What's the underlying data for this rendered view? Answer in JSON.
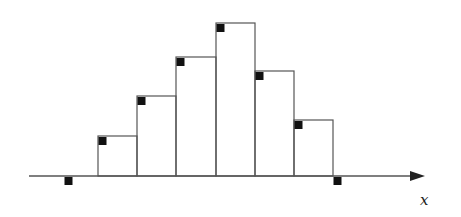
{
  "chart_data": {
    "type": "bar",
    "title": "",
    "xlabel": "x",
    "ylabel": "",
    "grid": false,
    "bins": [
      {
        "left": 98,
        "right": 137,
        "height": 40
      },
      {
        "left": 137,
        "right": 176,
        "height": 80
      },
      {
        "left": 176,
        "right": 216,
        "height": 119
      },
      {
        "left": 216,
        "right": 255,
        "height": 153
      },
      {
        "left": 255,
        "right": 294,
        "height": 105
      },
      {
        "left": 294,
        "right": 333,
        "height": 56
      }
    ],
    "values": [
      40,
      80,
      119,
      153,
      105,
      56
    ],
    "markers": [
      {
        "x": 64,
        "y": 0,
        "below_axis": true
      },
      {
        "x": 98,
        "y": 40
      },
      {
        "x": 137,
        "y": 80
      },
      {
        "x": 176,
        "y": 119
      },
      {
        "x": 216,
        "y": 153
      },
      {
        "x": 255,
        "y": 105
      },
      {
        "x": 294,
        "y": 56
      },
      {
        "x": 333,
        "y": 0,
        "below_axis": true
      }
    ]
  },
  "axis": {
    "label": "x",
    "baseline_y": 176,
    "start_x": 29,
    "end_x": 425
  },
  "colors": {
    "line": "#555555",
    "marker": "#111111"
  }
}
